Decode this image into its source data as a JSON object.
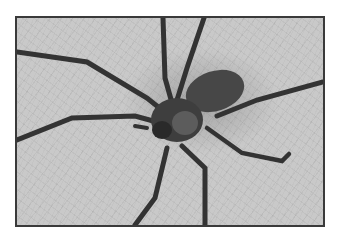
{
  "image": {
    "subject": "spider",
    "description": "Close-up grayscale photo of a long-legged spider on a textured fibrous surface, framed with a thin dark border",
    "colors": {
      "background": "#ffffff",
      "frame_border": "#3a3a3a",
      "surface": "#c9c9c9",
      "spider_body": "#3c3c3c",
      "abdomen": "#4a4a4a"
    }
  }
}
